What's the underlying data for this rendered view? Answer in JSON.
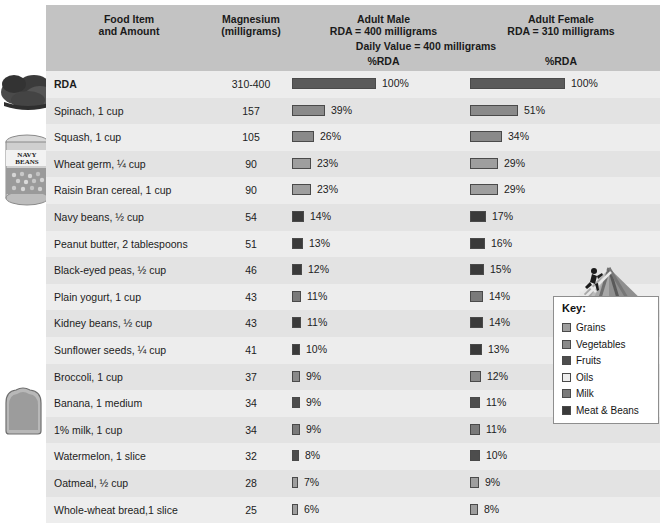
{
  "header": {
    "col_food": "Food Item\nand Amount",
    "col_food_line1": "Food Item",
    "col_food_line2": "and Amount",
    "col_mg_line1": "Magnesium",
    "col_mg_line2": "(milligrams)",
    "col_male_line1": "Adult Male",
    "col_male_line2": "RDA = 400 milligrams",
    "col_female_line1": "Adult Female",
    "col_female_line2": "RDA = 310 milligrams",
    "daily_value": "Daily Value = 400 milligrams",
    "pct_rda_male": "%RDA",
    "pct_rda_female": "%RDA"
  },
  "key": {
    "title": "Key:",
    "items": [
      {
        "label": "Grains",
        "color": "#9e9e9e"
      },
      {
        "label": "Vegetables",
        "color": "#8a8a8a"
      },
      {
        "label": "Fruits",
        "color": "#4d4d4d"
      },
      {
        "label": "Oils",
        "color": "#ededed"
      },
      {
        "label": "Milk",
        "color": "#7a7a7a"
      },
      {
        "label": "Meat & Beans",
        "color": "#3a3a3a"
      }
    ]
  },
  "images": [
    {
      "name": "spinach-photo",
      "alt": "Spinach leaves"
    },
    {
      "name": "navy-beans-can-photo",
      "alt": "Navy Beans can"
    },
    {
      "name": "bread-slice-photo",
      "alt": "Slice of whole-wheat bread"
    }
  ],
  "chart_data": {
    "type": "bar",
    "xlabel": "%RDA",
    "ylabel": "Food Item and Amount",
    "xlim": [
      0,
      100
    ],
    "grid": false,
    "legend_position": "right",
    "categories": [
      "RDA",
      "Spinach, 1 cup",
      "Squash, 1 cup",
      "Wheat germ, ¼ cup",
      "Raisin Bran cereal, 1 cup",
      "Navy beans, ½ cup",
      "Peanut butter, 2 tablespoons",
      "Black-eyed peas, ½ cup",
      "Plain yogurt, 1 cup",
      "Kidney beans, ½ cup",
      "Sunflower seeds, ¼ cup",
      "Broccoli, 1 cup",
      "Banana, 1 medium",
      "1% milk, 1 cup",
      "Watermelon, 1 slice",
      "Oatmeal, ½ cup",
      "Whole-wheat bread,1 slice"
    ],
    "magnesium_mg": [
      "310-400",
      "157",
      "105",
      "90",
      "90",
      "54",
      "51",
      "46",
      "43",
      "43",
      "41",
      "37",
      "34",
      "34",
      "32",
      "28",
      "25"
    ],
    "series": [
      {
        "name": "Adult Male %RDA",
        "values": [
          100,
          39,
          26,
          23,
          23,
          14,
          13,
          12,
          11,
          11,
          10,
          9,
          9,
          9,
          8,
          7,
          6
        ],
        "labels": [
          "100%",
          "39%",
          "26%",
          "23%",
          "23%",
          "14%",
          "13%",
          "12%",
          "11%",
          "11%",
          "10%",
          "9%",
          "9%",
          "9%",
          "8%",
          "7%",
          "6%"
        ]
      },
      {
        "name": "Adult Female %RDA",
        "values": [
          100,
          51,
          34,
          29,
          29,
          17,
          16,
          15,
          14,
          14,
          13,
          12,
          11,
          11,
          10,
          9,
          8
        ],
        "labels": [
          "100%",
          "51%",
          "34%",
          "29%",
          "29%",
          "17%",
          "16%",
          "15%",
          "14%",
          "14%",
          "13%",
          "12%",
          "11%",
          "11%",
          "10%",
          "9%",
          "8%"
        ]
      }
    ],
    "food_groups": [
      "RDA",
      "Vegetables",
      "Vegetables",
      "Grains",
      "Grains",
      "Meat & Beans",
      "Meat & Beans",
      "Meat & Beans",
      "Milk",
      "Meat & Beans",
      "Meat & Beans",
      "Vegetables",
      "Fruits",
      "Milk",
      "Fruits",
      "Grains",
      "Grains"
    ],
    "bar_colors": [
      "#5a5a5a",
      "#8a8a8a",
      "#8a8a8a",
      "#9e9e9e",
      "#9e9e9e",
      "#3a3a3a",
      "#3a3a3a",
      "#3a3a3a",
      "#7a7a7a",
      "#3a3a3a",
      "#3a3a3a",
      "#8a8a8a",
      "#4d4d4d",
      "#7a7a7a",
      "#4d4d4d",
      "#9e9e9e",
      "#9e9e9e"
    ]
  }
}
